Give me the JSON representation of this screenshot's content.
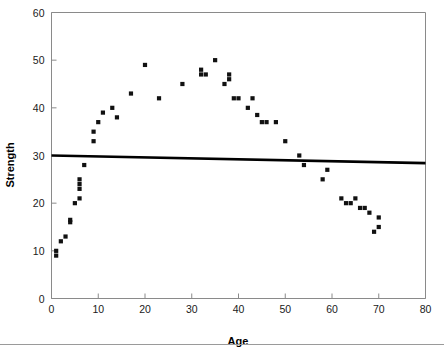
{
  "chart_data": {
    "type": "scatter",
    "title": "",
    "xlabel": "Age",
    "ylabel": "Strength",
    "xlim": [
      0,
      80
    ],
    "ylim": [
      0,
      60
    ],
    "xticks": [
      0,
      10,
      20,
      30,
      40,
      50,
      60,
      70,
      80
    ],
    "yticks": [
      0,
      10,
      20,
      30,
      40,
      50,
      60
    ],
    "grid": false,
    "legend": null,
    "point_marker": "filled-square",
    "point_color": "#111111",
    "series": [
      {
        "name": "Strength vs Age",
        "x": [
          1,
          1,
          2,
          3,
          4,
          4,
          5,
          6,
          6,
          6,
          6,
          7,
          9,
          9,
          10,
          11,
          13,
          14,
          17,
          20,
          23,
          28,
          32,
          32,
          33,
          35,
          37,
          38,
          38,
          39,
          40,
          42,
          43,
          44,
          45,
          46,
          48,
          50,
          53,
          54,
          58,
          59,
          62,
          63,
          64,
          65,
          66,
          67,
          68,
          69,
          70,
          70
        ],
        "y": [
          10,
          9,
          12,
          13,
          16,
          16.5,
          20,
          21,
          23,
          24,
          25,
          28,
          33,
          35,
          37,
          39,
          40,
          38,
          43,
          49,
          42,
          45,
          47,
          48,
          47,
          50,
          45,
          46,
          47,
          42,
          42,
          40,
          42,
          38.5,
          37,
          37,
          37,
          33,
          30,
          28,
          25,
          27,
          21,
          20,
          20,
          21,
          19,
          19,
          18,
          14,
          15,
          17
        ]
      }
    ],
    "trend_line": {
      "name": "fitted-regression-line",
      "x_start": 0,
      "y_start": 30.0,
      "x_end": 80,
      "y_end": 28.4,
      "color": "#000000"
    }
  },
  "axes": {
    "x": {
      "label": "Age",
      "tick_labels": [
        "0",
        "10",
        "20",
        "30",
        "40",
        "50",
        "60",
        "70",
        "80"
      ]
    },
    "y": {
      "label": "Strength",
      "tick_labels": [
        "0",
        "10",
        "20",
        "30",
        "40",
        "50",
        "60"
      ]
    }
  }
}
